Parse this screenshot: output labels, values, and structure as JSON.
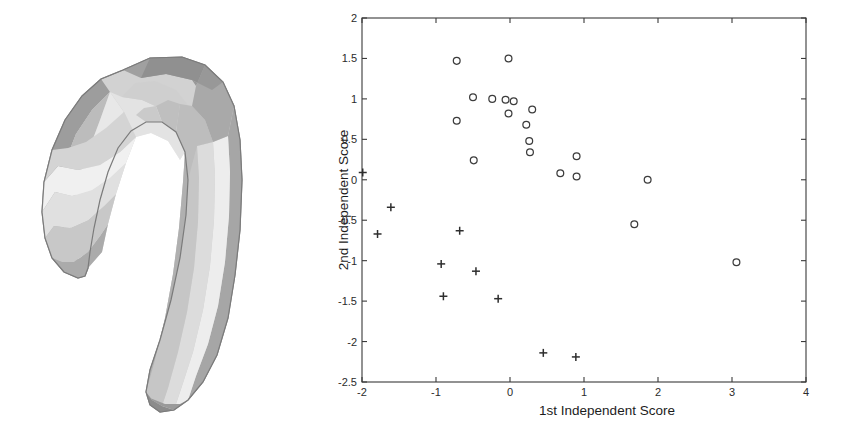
{
  "figure": {
    "background_color": "#ffffff",
    "ink_color": "#333333"
  },
  "shape_panel": {
    "name": "3d-surface-render",
    "description": "hippocampus-shaped 3d polygonal mesh render",
    "palette": {
      "light": "#f1f1f1",
      "mid_light": "#d9d9d9",
      "mid": "#c2c2c2",
      "mid_dark": "#a8a8a8",
      "dark": "#8e8e8e",
      "darkest": "#757575",
      "outline": "#6e6e6e"
    }
  },
  "chart_data": {
    "type": "scatter",
    "title": "",
    "xlabel": "1st Independent Score",
    "ylabel": "2nd Independent Score",
    "xlim": [
      -2,
      4
    ],
    "ylim": [
      -2.5,
      2
    ],
    "grid": false,
    "legend_position": "none",
    "xticks": [
      -2,
      -1,
      0,
      1,
      2,
      3,
      4
    ],
    "xticklabels": [
      "-2",
      "-1",
      "0",
      "1",
      "2",
      "3",
      "4"
    ],
    "yticks": [
      -2.5,
      -2,
      -1.5,
      -1,
      -0.5,
      0,
      0.5,
      1,
      1.5,
      2
    ],
    "yticklabels": [
      "-2.5",
      "-2",
      "-1.5",
      "-1",
      "-0.5",
      "0",
      "0.5",
      "1",
      "1.5",
      "2"
    ],
    "series": [
      {
        "name": "group-circles",
        "marker": "o",
        "color": "#3c3c3c",
        "x": [
          -0.72,
          -0.02,
          -0.5,
          -0.24,
          -0.06,
          0.05,
          0.3,
          -0.02,
          -0.72,
          0.22,
          0.26,
          -0.49,
          0.27,
          0.9,
          0.68,
          0.9,
          1.86,
          1.68,
          3.06
        ],
        "y": [
          1.47,
          1.5,
          1.02,
          1.0,
          0.99,
          0.97,
          0.87,
          0.82,
          0.73,
          0.68,
          0.48,
          0.24,
          0.34,
          0.29,
          0.08,
          0.04,
          0.0,
          -0.55,
          -1.02
        ]
      },
      {
        "name": "group-plus",
        "marker": "+",
        "color": "#2e2e2e",
        "x": [
          -1.99,
          -1.61,
          -1.79,
          -0.68,
          -0.93,
          -0.46,
          -0.9,
          -0.16,
          0.45,
          0.89
        ],
        "y": [
          0.09,
          -0.34,
          -0.67,
          -0.63,
          -1.04,
          -1.13,
          -1.44,
          -1.47,
          -2.14,
          -2.19
        ]
      }
    ]
  }
}
